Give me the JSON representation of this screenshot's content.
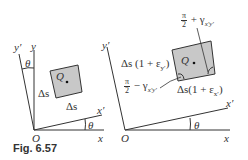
{
  "figure": {
    "caption": "Fig. 6.57",
    "left_panel": {
      "axes": {
        "x": "x",
        "y": "y",
        "x_prime": "x′",
        "y_prime": "y′",
        "origin": "O"
      },
      "angle_labels": [
        "θ",
        "θ"
      ],
      "element": {
        "point": "Q",
        "side_left": "Δs",
        "side_bottom": "Δs",
        "fill": "#c8c8c8"
      }
    },
    "right_panel": {
      "axes": {
        "x": "x",
        "x_prime": "x′",
        "y_prime": "y′",
        "origin": "O"
      },
      "angle_label": "θ",
      "element": {
        "point": "Q",
        "side_left": "Δs (1 + ε",
        "side_left_sub": "y′",
        "side_bottom": "Δs(1 + ε",
        "side_bottom_sub": "x′",
        "angle_top": {
          "num": "π",
          "den": "2",
          "rest": " + γ",
          "sub": "x′y′"
        },
        "angle_bottom": {
          "num": "π",
          "den": "2",
          "rest": " − γ",
          "sub": "x′y′"
        },
        "fill": "#c8c8c8"
      }
    },
    "colors": {
      "line": "#333333",
      "fill": "#c8c8c8",
      "background": "#ffffff"
    }
  }
}
